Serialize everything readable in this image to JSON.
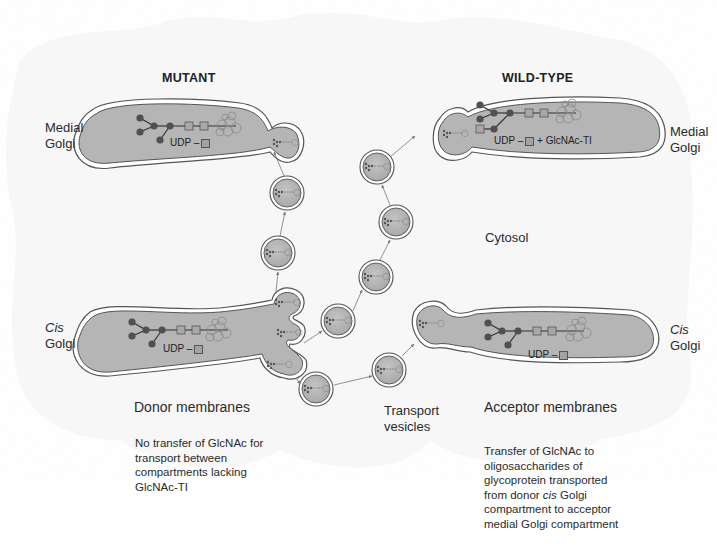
{
  "panels": {
    "mutant": {
      "heading": "MUTANT",
      "medial_label_line1": "Medial",
      "medial_label_line2": "Golgi",
      "cis_label_line1": "Cis",
      "cis_label_line2": "Golgi",
      "medial_udp": "UDP –",
      "cis_udp": "UDP –",
      "section_label": "Donor membranes",
      "note": "No transfer of GlcNAc for transport between compartments lacking GlcNAc-TI"
    },
    "wildtype": {
      "heading": "WILD-TYPE",
      "medial_label_line1": "Medial",
      "medial_label_line2": "Golgi",
      "cis_label_line1": "Cis",
      "cis_label_line2": "Golgi",
      "medial_udp": "UDP –",
      "medial_udp_suffix": "+ GlcNAc-TI",
      "cis_udp": "UDP –",
      "section_label": "Acceptor membranes",
      "note_part1": "Transfer of GlcNAc to oligosaccharides of glycoprotein transported from donor ",
      "note_italic": "cis",
      "note_part2": " Golgi compartment to acceptor medial Golgi compartment"
    }
  },
  "center": {
    "cytosol_label": "Cytosol",
    "vesicles_label_line1": "Transport",
    "vesicles_label_line2": "vesicles"
  },
  "colors": {
    "compartment_fill": "#b5b5b5",
    "membrane_stroke": "#555555",
    "sugar_circle": "#505050",
    "sugar_square": "#a8a8a8",
    "text": "#2a2a2a"
  }
}
